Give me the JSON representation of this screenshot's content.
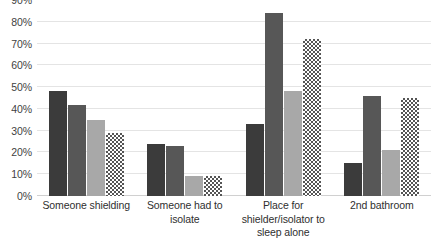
{
  "chart_data": {
    "type": "bar",
    "title": "",
    "xlabel": "",
    "ylabel": "",
    "ylim": [
      0,
      90
    ],
    "y_ticks": [
      0,
      10,
      20,
      30,
      40,
      50,
      60,
      70,
      80,
      90
    ],
    "y_tick_labels": [
      "0%",
      "10%",
      "20%",
      "30%",
      "40%",
      "50%",
      "60%",
      "70%",
      "80%",
      "90%"
    ],
    "grid": true,
    "legend": "none",
    "categories": [
      "Someone shielding",
      "Someone had to isolate",
      "Place for shielder/isolator to sleep alone",
      "2nd bathroom"
    ],
    "series": [
      {
        "name": "Series 1",
        "color": "#3b3b3b",
        "style": "solid-darkest",
        "values": [
          48,
          24,
          33,
          15
        ]
      },
      {
        "name": "Series 2",
        "color": "#575757",
        "style": "solid-dark",
        "values": [
          42,
          23,
          84,
          46
        ]
      },
      {
        "name": "Series 3",
        "color": "#a8a8a8",
        "style": "solid-light",
        "values": [
          35,
          9,
          48,
          21
        ]
      },
      {
        "name": "Series 4",
        "color": "#555555",
        "style": "checkerboard",
        "values": [
          29,
          9,
          72,
          45
        ]
      }
    ]
  }
}
